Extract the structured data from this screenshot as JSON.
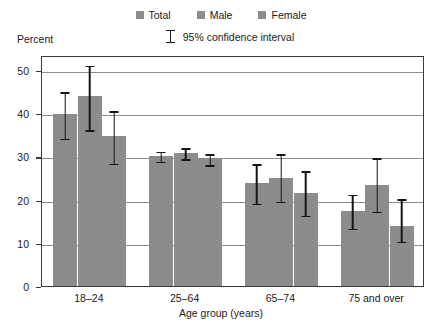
{
  "chart_data": {
    "type": "bar",
    "title": "",
    "subtitle": "",
    "xlabel": "Age group (years)",
    "ylabel": "Percent",
    "categories": [
      "18–24",
      "25–64",
      "65–74",
      "75 and over"
    ],
    "series": [
      {
        "name": "Total",
        "color": "#8c8c8c",
        "values": [
          39.8,
          30.2,
          23.9,
          17.4
        ],
        "ci_low": [
          34.2,
          28.9,
          19.2,
          13.4
        ],
        "ci_high": [
          45.3,
          31.6,
          28.7,
          21.6
        ]
      },
      {
        "name": "Male",
        "color": "#8c8c8c",
        "values": [
          44.1,
          30.9,
          25.0,
          23.4
        ],
        "ci_low": [
          36.2,
          29.4,
          19.6,
          17.3
        ],
        "ci_high": [
          51.5,
          32.4,
          31.0,
          30.0
        ]
      },
      {
        "name": "Female",
        "color": "#8c8c8c",
        "values": [
          34.8,
          29.6,
          21.5,
          13.9
        ],
        "ci_low": [
          28.4,
          28.1,
          16.4,
          10.4
        ],
        "ci_high": [
          41.0,
          31.0,
          27.0,
          20.5
        ]
      }
    ],
    "yticks": [
      0,
      10,
      20,
      30,
      40,
      50
    ],
    "ylim": [
      0,
      53.5
    ],
    "grid": "horizontal",
    "legend_position": "top-center",
    "error_bar_label": "95% confidence interval"
  },
  "legend": {
    "items": [
      {
        "label": "Total",
        "color": "#8c8c8c"
      },
      {
        "label": "Male",
        "color": "#8c8c8c"
      },
      {
        "label": "Female",
        "color": "#8c8c8c"
      }
    ],
    "ci_label": "95% confidence interval"
  },
  "axes": {
    "y_axis_caption": "Percent",
    "x_axis_title": "Age group (years)"
  }
}
